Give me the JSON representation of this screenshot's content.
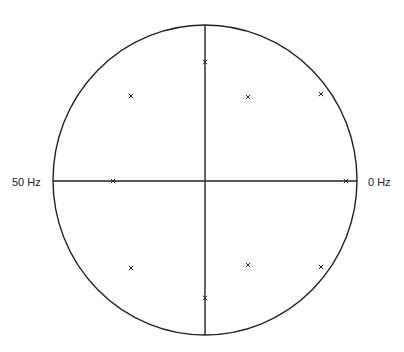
{
  "diagram": {
    "type": "pole-zero plot (z-plane unit circle)",
    "labels": {
      "left": "50 Hz",
      "right": "0 Hz"
    },
    "colors": {
      "line": "#222222",
      "background": "#ffffff"
    },
    "circle": {
      "cx": 205,
      "cy": 180,
      "rx": 152,
      "ry": 155
    },
    "poles": [
      {
        "x": 131,
        "y": 96
      },
      {
        "x": 205,
        "y": 62
      },
      {
        "x": 248,
        "y": 97
      },
      {
        "x": 321,
        "y": 94
      },
      {
        "x": 113,
        "y": 181
      },
      {
        "x": 346,
        "y": 181
      },
      {
        "x": 131,
        "y": 268
      },
      {
        "x": 205,
        "y": 298
      },
      {
        "x": 248,
        "y": 265
      },
      {
        "x": 321,
        "y": 267
      }
    ]
  }
}
